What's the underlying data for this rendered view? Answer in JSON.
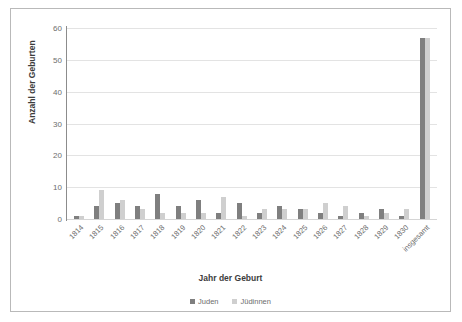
{
  "chart_data": {
    "type": "bar",
    "title": "",
    "xlabel": "Jahr der Geburt",
    "ylabel": "Anzahl der Geburten",
    "ylim": [
      0,
      60
    ],
    "yticks": [
      0,
      10,
      20,
      30,
      40,
      50,
      60
    ],
    "grid": true,
    "legend_position": "bottom",
    "categories": [
      "1814",
      "1815",
      "1816",
      "1817",
      "1818",
      "1819",
      "1820",
      "1821",
      "1822",
      "1823",
      "1824",
      "1825",
      "1826",
      "1827",
      "1828",
      "1829",
      "1830",
      "insgesamt"
    ],
    "series": [
      {
        "name": "Juden",
        "color": "#7f7f7f",
        "values": [
          1,
          4,
          5,
          4,
          8,
          4,
          6,
          2,
          5,
          2,
          4,
          3,
          2,
          1,
          2,
          3,
          1,
          57
        ]
      },
      {
        "name": "Jüdinnen",
        "color": "#cfcfcf",
        "values": [
          1,
          9,
          6,
          3,
          2,
          2,
          2,
          7,
          1,
          3,
          3,
          3,
          5,
          4,
          1,
          2,
          3,
          57
        ]
      }
    ]
  }
}
